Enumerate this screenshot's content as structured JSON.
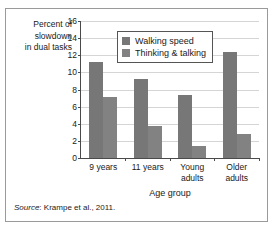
{
  "chart_data": {
    "type": "bar",
    "title": "",
    "categories": [
      "9 years",
      "11 years",
      "Young adults",
      "Older adults"
    ],
    "series": [
      {
        "name": "Walking speed",
        "values": [
          11.2,
          9.2,
          7.4,
          12.4
        ],
        "color": "#777777"
      },
      {
        "name": "Thinking & talking",
        "values": [
          7.1,
          3.7,
          1.4,
          2.8
        ],
        "color": "#828282"
      }
    ],
    "xlabel": "Age group",
    "ylabel": "Percent of slowdown in dual tasks",
    "ylabel_lines": [
      "Percent of",
      "slowdown",
      "in dual tasks"
    ],
    "yticks": [
      0,
      2,
      4,
      6,
      8,
      10,
      12,
      14,
      16
    ],
    "ylim": [
      0,
      16
    ],
    "grid": true,
    "legend_position": "top-center"
  },
  "legend": {
    "items": [
      {
        "label": "Walking speed"
      },
      {
        "label": "Thinking & talking"
      }
    ]
  },
  "source": {
    "word": "Source",
    "separator": ":",
    "citation": " Krampe et al., 2011."
  }
}
